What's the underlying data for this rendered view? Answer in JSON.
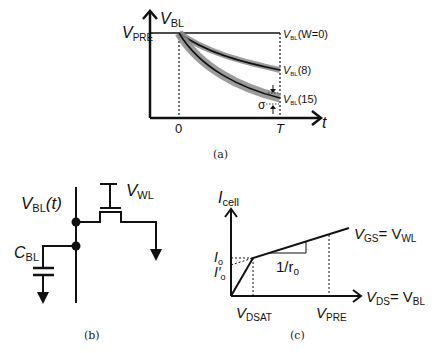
{
  "figure_a": {
    "caption": "(a)",
    "y_axis_label": "V",
    "y_axis_sub": "BL",
    "x_axis_label": "t",
    "level_label": "V",
    "level_sub": "PRE",
    "tick_zero": "0",
    "tick_T": "T",
    "sigma_label": "σ",
    "curves": [
      {
        "label_main": "V",
        "label_sub": "BL",
        "label_arg": "(W=0)"
      },
      {
        "label_main": "V",
        "label_sub": "BL",
        "label_arg": "(8)"
      },
      {
        "label_main": "V",
        "label_sub": "BL",
        "label_arg": "(15)"
      }
    ]
  },
  "figure_b": {
    "caption": "(b)",
    "node_label": "V",
    "node_sub": "BL",
    "node_arg": "(t)",
    "gate_label": "V",
    "gate_sub": "WL",
    "cap_label": "C",
    "cap_sub": "BL"
  },
  "figure_c": {
    "caption": "(c)",
    "y_axis_label": "I",
    "y_axis_sub": "cell",
    "x_axis_label": "V",
    "x_axis_sub": "DS",
    "x_axis_eq": "= V",
    "x_axis_eq_sub": "BL",
    "curve_label": "V",
    "curve_sub": "GS",
    "curve_eq": "= V",
    "curve_eq_sub": "WL",
    "io_label": "I",
    "io_sub": "o",
    "io_prime_label": "I′",
    "io_prime_sub": "o",
    "slope_label": "1/r",
    "slope_sub": "o",
    "vdsat_label": "V",
    "vdsat_sub": "DSAT",
    "vpre_label": "V",
    "vpre_sub": "PRE"
  }
}
